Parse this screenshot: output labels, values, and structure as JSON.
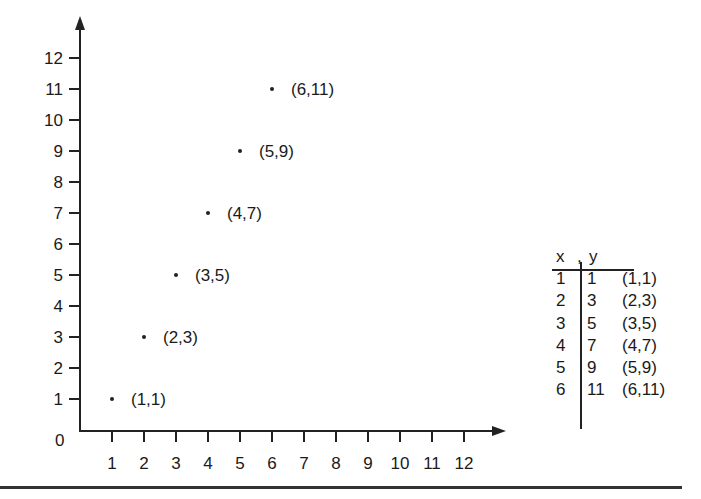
{
  "chart_data": {
    "type": "scatter",
    "title": "",
    "xlabel": "",
    "ylabel": "",
    "xlim": [
      0,
      12
    ],
    "ylim": [
      0,
      12
    ],
    "grid": false,
    "origin_label": "0",
    "x_ticks": [
      "1",
      "2",
      "3",
      "4",
      "5",
      "6",
      "7",
      "8",
      "9",
      "10",
      "11",
      "12"
    ],
    "y_ticks": [
      "1",
      "2",
      "3",
      "4",
      "5",
      "6",
      "7",
      "8",
      "9",
      "10",
      "11",
      "12"
    ],
    "points": [
      {
        "x": 1,
        "y": 1,
        "label": "(1,1)"
      },
      {
        "x": 2,
        "y": 3,
        "label": "(2,3)"
      },
      {
        "x": 3,
        "y": 5,
        "label": "(3,5)"
      },
      {
        "x": 4,
        "y": 7,
        "label": "(4,7)"
      },
      {
        "x": 5,
        "y": 9,
        "label": "(5,9)"
      },
      {
        "x": 6,
        "y": 11,
        "label": "(6,11)"
      }
    ]
  },
  "table": {
    "header_x": "x",
    "header_sep": ",",
    "header_y": "y",
    "rows": [
      {
        "x": "1",
        "y": "1",
        "pair": "(1,1)"
      },
      {
        "x": "2",
        "y": "3",
        "pair": "(2,3)"
      },
      {
        "x": "3",
        "y": "5",
        "pair": "(3,5)"
      },
      {
        "x": "4",
        "y": "7",
        "pair": "(4,7)"
      },
      {
        "x": "5",
        "y": "9",
        "pair": "(5,9)"
      },
      {
        "x": "6",
        "y": "11",
        "pair": "(6,11)"
      }
    ]
  },
  "colors": {
    "ink": "#1a1a1a",
    "background": "#ffffff"
  }
}
